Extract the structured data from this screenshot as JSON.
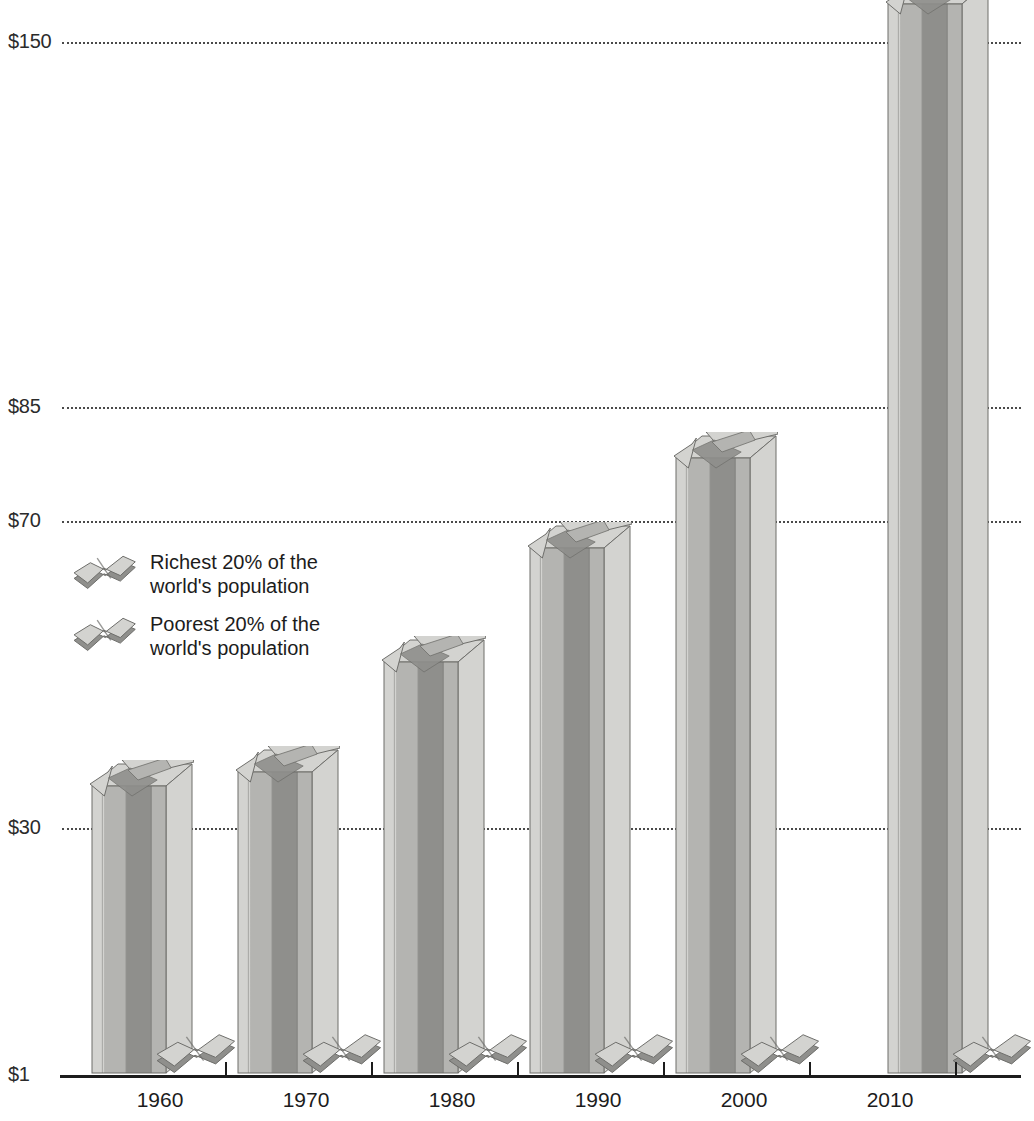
{
  "chart_data": {
    "type": "bar",
    "title": "",
    "subtitle": "",
    "xlabel": "",
    "ylabel": "",
    "categories": [
      "1960",
      "1970",
      "1980",
      "1990",
      "2000",
      "2010"
    ],
    "series": [
      {
        "name": "Richest 20% of the world's population",
        "values": [
          30,
          32,
          45,
          62,
          72,
          150
        ]
      },
      {
        "name": "Poorest 20% of the world's population",
        "values": [
          1,
          1,
          1,
          1,
          1,
          1
        ]
      }
    ],
    "y_tick_labels": [
      "$150",
      "$85",
      "$70",
      "$30",
      "$1"
    ],
    "y_tick_values": [
      150,
      85,
      70,
      30,
      1
    ],
    "ylim": [
      1,
      150
    ],
    "grid": true,
    "grid_style": "dotted-horizontal",
    "legend_position": "inside-left",
    "axis_scale": "non-linear",
    "bar_style": "3d-extruded-dollar-sign",
    "colors": {
      "bar_light": "#d3d3d0",
      "bar_mid": "#b4b4b1",
      "bar_dark": "#8f8f8c",
      "bar_edge": "#6e6e6b",
      "gridline": "#4a4a4a",
      "axis": "#1c1c1c",
      "text": "#1c1c1c",
      "background": "#ffffff"
    }
  },
  "legend": {
    "items": [
      {
        "label_line1": "Richest 20% of the",
        "label_line2": "world's population",
        "icon": "dollar-sign-3d-icon"
      },
      {
        "label_line1": "Poorest 20% of the",
        "label_line2": "world's population",
        "icon": "dollar-sign-3d-icon"
      }
    ]
  },
  "axis": {
    "y_ticks": [
      {
        "label": "$150",
        "y": 42
      },
      {
        "label": "$85",
        "y": 407
      },
      {
        "label": "$70",
        "y": 521
      },
      {
        "label": "$30",
        "y": 828
      },
      {
        "label": "$1",
        "y": 1075
      }
    ],
    "x_ticks": [
      {
        "label": "1960",
        "x": 160
      },
      {
        "label": "1970",
        "x": 306
      },
      {
        "label": "1980",
        "x": 452
      },
      {
        "label": "1990",
        "x": 598
      },
      {
        "label": "2000",
        "x": 744
      },
      {
        "label": "2010",
        "x": 890
      }
    ]
  },
  "bars": [
    {
      "year": "1960",
      "rich_top_y": 786,
      "poor_top_y": 1040,
      "left": 88
    },
    {
      "year": "1970",
      "rich_top_y": 772,
      "poor_top_y": 1040,
      "left": 234
    },
    {
      "year": "1980",
      "rich_top_y": 662,
      "poor_top_y": 1040,
      "left": 380
    },
    {
      "year": "1990",
      "rich_top_y": 548,
      "poor_top_y": 1040,
      "left": 526
    },
    {
      "year": "2000",
      "rich_top_y": 458,
      "poor_top_y": 1040,
      "left": 672
    },
    {
      "year": "2010",
      "rich_top_y": 4,
      "poor_top_y": 1040,
      "left": 884
    }
  ]
}
